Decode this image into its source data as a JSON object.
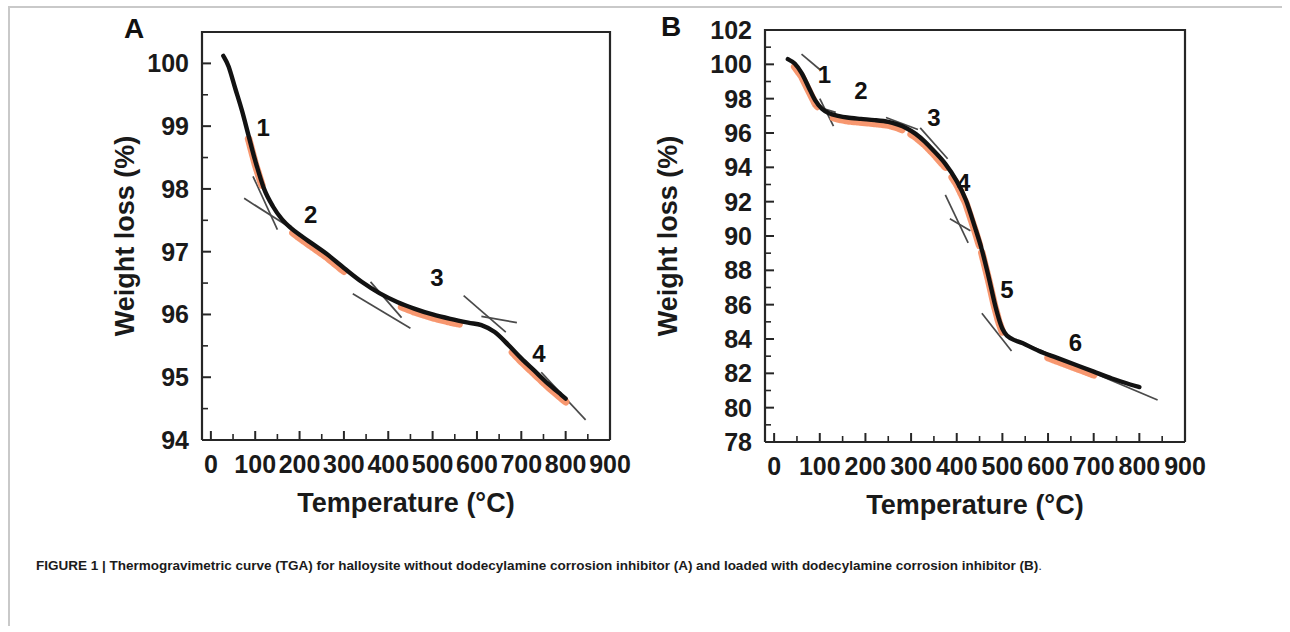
{
  "figure": {
    "caption_prefix": "FIGURE 1",
    "caption_separator": " | ",
    "caption_bold": "Thermogravimetric curve (TGA) for halloysite without dodecylamine corrosion inhibitor (A) and loaded with dodecylamine corrosion inhibitor (B)",
    "caption_end": ".",
    "colors": {
      "curve": "#121212",
      "highlight": "#F79167",
      "tangent": "#4a4a4a",
      "axis": "#262626",
      "rule": "#c9c9c9"
    }
  },
  "chart_data": [
    {
      "type": "line",
      "panel": "A",
      "panel_letter": "A",
      "title": "",
      "xlabel": "Temperature (°C)",
      "ylabel": "Weight loss (%)",
      "xlim": [
        -20,
        900
      ],
      "ylim": [
        94,
        100.5
      ],
      "xticks": [
        0,
        100,
        200,
        300,
        400,
        500,
        600,
        700,
        800,
        900
      ],
      "xticklabels": [
        "0",
        "100",
        "200",
        "300",
        "400",
        "500",
        "600",
        "700",
        "800",
        "900"
      ],
      "yticks": [
        94,
        95,
        96,
        97,
        98,
        99,
        100
      ],
      "yticklabels": [
        "94",
        "95",
        "96",
        "97",
        "98",
        "99",
        "100"
      ],
      "grid": false,
      "legend": "none",
      "series": [
        {
          "name": "TGA halloysite (no inhibitor)",
          "x": [
            28,
            40,
            55,
            70,
            85,
            100,
            120,
            140,
            160,
            180,
            200,
            230,
            260,
            300,
            340,
            380,
            420,
            460,
            500,
            540,
            580,
            610,
            640,
            670,
            700,
            730,
            760,
            790,
            800
          ],
          "y": [
            100.12,
            99.95,
            99.6,
            99.25,
            98.85,
            98.45,
            98.0,
            97.72,
            97.52,
            97.38,
            97.27,
            97.12,
            96.97,
            96.74,
            96.52,
            96.34,
            96.2,
            96.09,
            96.0,
            95.93,
            95.87,
            95.83,
            95.72,
            95.52,
            95.3,
            95.1,
            94.9,
            94.72,
            94.66
          ]
        }
      ],
      "segments": [
        {
          "label": "1",
          "x_range": [
            85,
            115
          ],
          "label_x": 118,
          "label_y": 98.85
        },
        {
          "label": "2",
          "x_range": [
            185,
            300
          ],
          "label_x": 225,
          "label_y": 97.45
        },
        {
          "label": "3",
          "x_range": [
            430,
            560
          ],
          "label_x": 510,
          "label_y": 96.45
        },
        {
          "label": "4",
          "x_range": [
            680,
            800
          ],
          "label_x": 740,
          "label_y": 95.25
        }
      ],
      "tangents": [
        {
          "x1": 75,
          "y1": 97.85,
          "x2": 175,
          "y2": 97.4
        },
        {
          "x1": 95,
          "y1": 98.2,
          "x2": 150,
          "y2": 97.35
        },
        {
          "x1": 320,
          "y1": 96.33,
          "x2": 450,
          "y2": 95.78
        },
        {
          "x1": 360,
          "y1": 96.52,
          "x2": 430,
          "y2": 95.95
        },
        {
          "x1": 570,
          "y1": 96.3,
          "x2": 665,
          "y2": 95.72
        },
        {
          "x1": 610,
          "y1": 95.97,
          "x2": 690,
          "y2": 95.87
        },
        {
          "x1": 745,
          "y1": 95.08,
          "x2": 845,
          "y2": 94.32
        }
      ]
    },
    {
      "type": "line",
      "panel": "B",
      "panel_letter": "B",
      "title": "",
      "xlabel": "Temperature (°C)",
      "ylabel": "Weight loss (%)",
      "xlim": [
        -20,
        900
      ],
      "ylim": [
        78,
        102
      ],
      "xticks": [
        0,
        100,
        200,
        300,
        400,
        500,
        600,
        700,
        800,
        900
      ],
      "xticklabels": [
        "0",
        "100",
        "200",
        "300",
        "400",
        "500",
        "600",
        "700",
        "800",
        "900"
      ],
      "yticks": [
        78,
        80,
        82,
        84,
        86,
        88,
        90,
        92,
        94,
        96,
        98,
        100,
        102
      ],
      "yticklabels": [
        "78",
        "80",
        "82",
        "84",
        "86",
        "88",
        "90",
        "92",
        "94",
        "96",
        "98",
        "100",
        "102"
      ],
      "grid": false,
      "legend": "none",
      "series": [
        {
          "name": "TGA halloysite loaded with dodecylamine",
          "x": [
            30,
            45,
            60,
            75,
            90,
            105,
            120,
            140,
            160,
            190,
            220,
            250,
            270,
            290,
            310,
            330,
            350,
            375,
            400,
            420,
            440,
            455,
            470,
            482,
            492,
            500,
            510,
            525,
            545,
            580,
            620,
            660,
            700,
            740,
            780,
            800
          ],
          "y": [
            100.3,
            100.05,
            99.5,
            98.7,
            97.9,
            97.4,
            97.15,
            97.0,
            96.9,
            96.82,
            96.75,
            96.65,
            96.5,
            96.28,
            95.95,
            95.5,
            94.95,
            94.2,
            93.2,
            92.1,
            90.5,
            89.2,
            87.6,
            86.2,
            85.2,
            84.6,
            84.2,
            83.95,
            83.75,
            83.3,
            82.9,
            82.5,
            82.1,
            81.7,
            81.35,
            81.2
          ]
        }
      ],
      "segments": [
        {
          "label": "1",
          "x_range": [
            45,
            95
          ],
          "label_x": 110,
          "label_y": 98.9
        },
        {
          "label": "2",
          "x_range": [
            130,
            280
          ],
          "label_x": 190,
          "label_y": 98.0
        },
        {
          "label": "3",
          "x_range": [
            300,
            375
          ],
          "label_x": 350,
          "label_y": 96.4
        },
        {
          "label": "4",
          "x_range": [
            390,
            450
          ],
          "label_x": 415,
          "label_y": 92.6
        },
        {
          "label": "5",
          "x_range": [
            455,
            500
          ],
          "label_x": 510,
          "label_y": 86.4
        },
        {
          "label": "6",
          "x_range": [
            600,
            700
          ],
          "label_x": 660,
          "label_y": 83.3
        }
      ],
      "tangents": [
        {
          "x1": 60,
          "y1": 100.6,
          "x2": 100,
          "y2": 99.7
        },
        {
          "x1": 85,
          "y1": 97.6,
          "x2": 135,
          "y2": 97.2
        },
        {
          "x1": 100,
          "y1": 98.0,
          "x2": 130,
          "y2": 96.4
        },
        {
          "x1": 245,
          "y1": 96.9,
          "x2": 315,
          "y2": 96.2
        },
        {
          "x1": 320,
          "y1": 96.3,
          "x2": 380,
          "y2": 94.5
        },
        {
          "x1": 375,
          "y1": 92.4,
          "x2": 425,
          "y2": 89.6
        },
        {
          "x1": 385,
          "y1": 91.0,
          "x2": 430,
          "y2": 90.3
        },
        {
          "x1": 455,
          "y1": 85.5,
          "x2": 520,
          "y2": 83.3
        },
        {
          "x1": 560,
          "y1": 83.6,
          "x2": 840,
          "y2": 80.45
        }
      ]
    }
  ]
}
